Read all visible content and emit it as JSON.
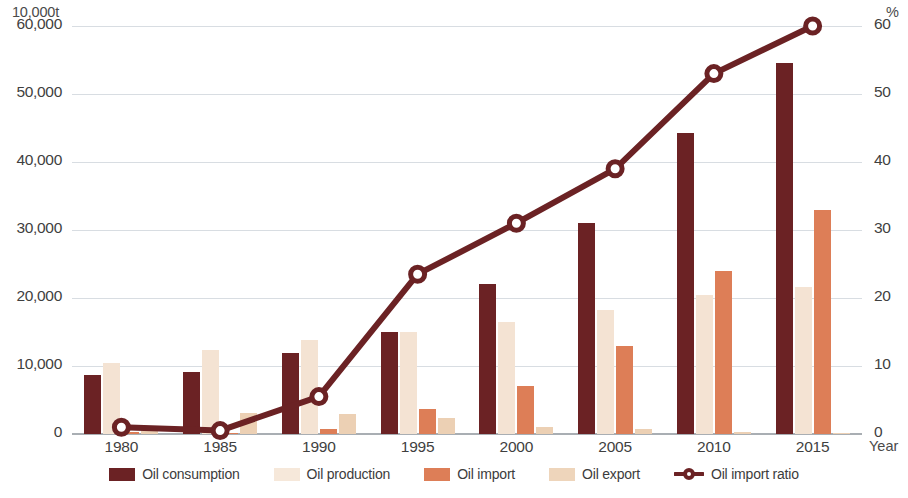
{
  "axes": {
    "left_unit": "10,000t",
    "right_unit": "%",
    "x_title": "Year",
    "left_ticks": [
      "60,000",
      "50,000",
      "40,000",
      "30,000",
      "20,000",
      "10,000",
      "0"
    ],
    "right_ticks": [
      "60",
      "50",
      "40",
      "30",
      "20",
      "10",
      "0"
    ],
    "x_ticks": [
      "1980",
      "1985",
      "1990",
      "1995",
      "2000",
      "2005",
      "2010",
      "2015"
    ]
  },
  "legend": {
    "items": [
      {
        "label": "Oil consumption",
        "key": "consumption",
        "color": "#6b2224",
        "marker": "square"
      },
      {
        "label": "Oil production",
        "key": "production",
        "color": "#f6e8da",
        "marker": "square"
      },
      {
        "label": "Oil import",
        "key": "import",
        "color": "#dd7e57",
        "marker": "square"
      },
      {
        "label": "Oil export",
        "key": "export",
        "color": "#eed5bb",
        "marker": "square"
      },
      {
        "label": "Oil import ratio",
        "key": "ratio",
        "color": "#6b2224",
        "marker": "line-circle"
      }
    ]
  },
  "chart_data": {
    "type": "bar",
    "title": "",
    "xlabel": "Year",
    "ylabel": "10,000t",
    "y2label": "%",
    "categories": [
      "1980",
      "1985",
      "1990",
      "1995",
      "2000",
      "2005",
      "2010",
      "2015"
    ],
    "ylim": [
      0,
      60000
    ],
    "y2lim": [
      0,
      60
    ],
    "ytick_step": 10000,
    "y2tick_step": 10,
    "grid": true,
    "legend_position": "bottom",
    "series": [
      {
        "name": "Oil consumption",
        "type": "bar",
        "axis": "left",
        "color": "#6b2224",
        "values": [
          8700,
          9100,
          11900,
          15000,
          22000,
          31000,
          44200,
          54600
        ]
      },
      {
        "name": "Oil production",
        "type": "bar",
        "axis": "left",
        "color": "#f4e3d3",
        "values": [
          10500,
          12400,
          13800,
          15000,
          16400,
          18200,
          20400,
          21600
        ]
      },
      {
        "name": "Oil import",
        "type": "bar",
        "axis": "left",
        "color": "#dd7e57",
        "values": [
          300,
          200,
          750,
          3700,
          7100,
          12900,
          24000,
          33000
        ]
      },
      {
        "name": "Oil export",
        "type": "bar",
        "axis": "left",
        "color": "#ecd0b4",
        "values": [
          1200,
          3100,
          3000,
          2400,
          1000,
          800,
          300,
          200
        ]
      },
      {
        "name": "Oil import ratio",
        "type": "line",
        "axis": "right",
        "color": "#6b2224",
        "marker": "open-circle",
        "values": [
          1,
          0.5,
          5.5,
          23.5,
          31,
          39,
          53,
          60
        ]
      }
    ]
  }
}
